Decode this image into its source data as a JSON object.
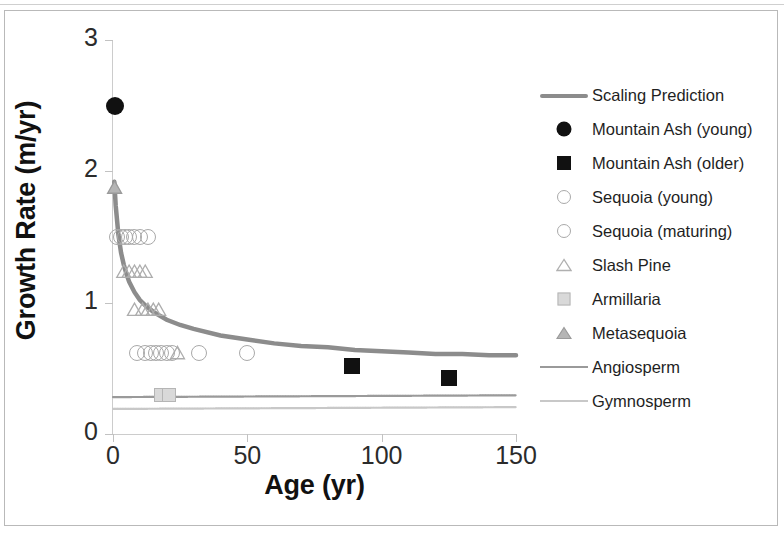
{
  "chart_data": {
    "type": "scatter",
    "title": "",
    "xlabel": "Age (yr)",
    "ylabel": "Growth Rate (m/yr)",
    "xlim": [
      0,
      150
    ],
    "ylim": [
      0,
      3
    ],
    "xticks": [
      "0",
      "50",
      "100",
      "150"
    ],
    "yticks": [
      "0",
      "1",
      "2",
      "3"
    ],
    "xtick_values": [
      0,
      50,
      100,
      150
    ],
    "ytick_values": [
      0,
      1,
      2,
      3
    ],
    "grid": false,
    "legend_position": "right",
    "series": [
      {
        "name": "Scaling Prediction",
        "type": "line",
        "color": "#8c8c8c",
        "marker": "line",
        "points": [
          [
            0.5,
            1.92
          ],
          [
            1,
            1.74
          ],
          [
            2,
            1.52
          ],
          [
            3,
            1.38
          ],
          [
            4,
            1.29
          ],
          [
            5,
            1.22
          ],
          [
            6,
            1.16
          ],
          [
            8,
            1.08
          ],
          [
            10,
            1.02
          ],
          [
            12,
            0.98
          ],
          [
            15,
            0.93
          ],
          [
            20,
            0.87
          ],
          [
            25,
            0.83
          ],
          [
            30,
            0.8
          ],
          [
            40,
            0.75
          ],
          [
            50,
            0.72
          ],
          [
            60,
            0.69
          ],
          [
            70,
            0.67
          ],
          [
            80,
            0.66
          ],
          [
            90,
            0.64
          ],
          [
            100,
            0.63
          ],
          [
            110,
            0.62
          ],
          [
            120,
            0.61
          ],
          [
            130,
            0.61
          ],
          [
            140,
            0.6
          ],
          [
            150,
            0.6
          ]
        ]
      },
      {
        "name": "Mountain Ash (young)",
        "type": "scatter",
        "marker": "filled-circle",
        "color": "#111111",
        "points": [
          [
            0.8,
            2.5
          ]
        ]
      },
      {
        "name": "Mountain Ash (older)",
        "type": "scatter",
        "marker": "filled-square",
        "color": "#111111",
        "points": [
          [
            89,
            0.52
          ],
          [
            125,
            0.43
          ]
        ]
      },
      {
        "name": "Sequoia (young)",
        "type": "scatter",
        "marker": "open-circle",
        "color": "#a9a9a9",
        "points": [
          [
            1.5,
            1.5
          ],
          [
            3,
            1.5
          ],
          [
            4.5,
            1.5
          ],
          [
            6,
            1.5
          ],
          [
            8,
            1.5
          ],
          [
            10,
            1.5
          ],
          [
            13,
            1.5
          ]
        ]
      },
      {
        "name": "Sequoia (maturing)",
        "type": "scatter",
        "marker": "open-circle",
        "color": "#a9a9a9",
        "points": [
          [
            9,
            0.62
          ],
          [
            12,
            0.62
          ],
          [
            14,
            0.62
          ],
          [
            16,
            0.62
          ],
          [
            18,
            0.62
          ],
          [
            20,
            0.62
          ],
          [
            22,
            0.62
          ],
          [
            32,
            0.62
          ],
          [
            50,
            0.62
          ]
        ]
      },
      {
        "name": "Slash Pine",
        "type": "scatter",
        "marker": "open-triangle",
        "color": "#adadad",
        "points": [
          [
            4,
            1.24
          ],
          [
            6,
            1.24
          ],
          [
            8,
            1.24
          ],
          [
            10,
            1.24
          ],
          [
            12,
            1.24
          ],
          [
            8,
            0.95
          ],
          [
            11,
            0.95
          ],
          [
            13,
            0.95
          ],
          [
            15,
            0.95
          ],
          [
            17,
            0.95
          ],
          [
            24,
            0.62
          ]
        ]
      },
      {
        "name": "Armillaria",
        "type": "scatter",
        "marker": "filled-outline-square",
        "color": "#c0c0c0",
        "points": [
          [
            18,
            0.3
          ],
          [
            21,
            0.3
          ]
        ]
      },
      {
        "name": "Metasequoia",
        "type": "scatter",
        "marker": "shaded-triangle",
        "color": "#9a9a9a",
        "points": [
          [
            0.6,
            1.88
          ]
        ]
      },
      {
        "name": "Angiosperm",
        "type": "hline",
        "marker": "thin-line",
        "color": "#9a9a9a",
        "value": 0.29
      },
      {
        "name": "Gymnosperm",
        "type": "hline",
        "marker": "faint-line",
        "color": "#c8c8c8",
        "value": 0.2
      }
    ]
  },
  "legend": {
    "items": [
      {
        "label": "Scaling Prediction",
        "key": "thick-line-key"
      },
      {
        "label": "Mountain Ash (young)",
        "key": "filled-circle-key"
      },
      {
        "label": "Mountain Ash (older)",
        "key": "filled-square-key"
      },
      {
        "label": "Sequoia (young)",
        "key": "open-circle-key"
      },
      {
        "label": "Sequoia (maturing)",
        "key": "open-circle-key"
      },
      {
        "label": "Slash Pine",
        "key": "open-triangle-key"
      },
      {
        "label": "Armillaria",
        "key": "shaded-square-key"
      },
      {
        "label": "Metasequoia",
        "key": "shaded-triangle-key"
      },
      {
        "label": "Angiosperm",
        "key": "thin-line-key"
      },
      {
        "label": "Gymnosperm",
        "key": "faint-line-key"
      }
    ]
  },
  "colors": {
    "scaling_prediction": "#8c8c8c",
    "mountain_ash": "#111111",
    "sequoia": "#a9a9a9",
    "slash_pine": "#adadad",
    "armillaria": "#c0c0c0",
    "metasequoia": "#9a9a9a",
    "angiosperm": "#9a9a9a",
    "gymnosperm": "#c8c8c8",
    "axis": "#cccccc",
    "text": "#1f1f1f"
  }
}
